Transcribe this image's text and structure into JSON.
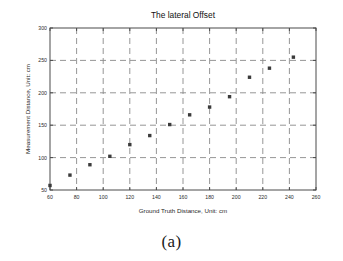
{
  "figure": {
    "caption": "(a)"
  },
  "chart_data": {
    "type": "scatter",
    "title": "The lateral Offset",
    "xlabel": "Ground Truth Distance, Unit: cm",
    "ylabel": "Measurement Distance, Unit: cm",
    "xlim": [
      60,
      260
    ],
    "ylim": [
      50,
      300
    ],
    "xticks": [
      60,
      80,
      100,
      120,
      140,
      160,
      180,
      200,
      220,
      240,
      260
    ],
    "xtick_labels": [
      "60",
      "80",
      "100",
      "120",
      "140",
      "160",
      "180",
      "200",
      "220",
      "240",
      "260"
    ],
    "yticks": [
      50,
      100,
      150,
      200,
      250,
      300
    ],
    "ytick_labels": [
      "50",
      "100",
      "150",
      "200",
      "250",
      "300"
    ],
    "grid": true,
    "grid_style": "dashed",
    "legend": null,
    "marker": "filled-square",
    "marker_color": "#3b3b3b",
    "x": [
      60,
      75,
      90,
      105,
      120,
      135,
      150,
      165,
      180,
      195,
      210,
      225,
      243
    ],
    "y": [
      57,
      73,
      89,
      102,
      120,
      134,
      151,
      166,
      178,
      194,
      224,
      238,
      255
    ],
    "points": [
      {
        "x": 60,
        "y": 57
      },
      {
        "x": 75,
        "y": 73
      },
      {
        "x": 90,
        "y": 89
      },
      {
        "x": 105,
        "y": 102
      },
      {
        "x": 120,
        "y": 120
      },
      {
        "x": 135,
        "y": 134
      },
      {
        "x": 150,
        "y": 151
      },
      {
        "x": 165,
        "y": 166
      },
      {
        "x": 180,
        "y": 178
      },
      {
        "x": 195,
        "y": 194
      },
      {
        "x": 210,
        "y": 224
      },
      {
        "x": 225,
        "y": 238
      },
      {
        "x": 243,
        "y": 255
      }
    ]
  }
}
